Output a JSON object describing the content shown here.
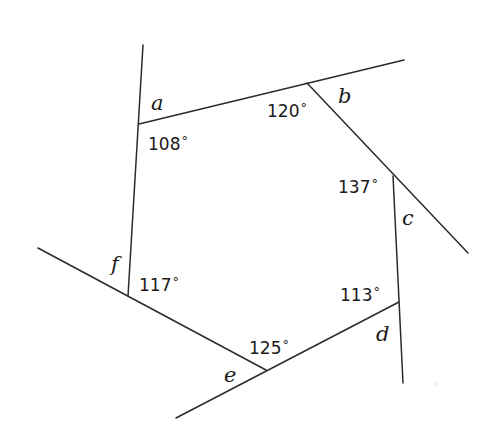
{
  "diagram": {
    "type": "hexagon-exterior-angles",
    "stroke_color": "#2b2b2b",
    "vertices": {
      "a": [
        139,
        124
      ],
      "b": [
        307,
        83
      ],
      "c": [
        393,
        176
      ],
      "d": [
        399,
        302
      ],
      "e": [
        266,
        370
      ],
      "f": [
        128,
        296
      ]
    },
    "lines": [
      {
        "id": "line-fa",
        "x1": 143,
        "y1": 45,
        "x2": 128,
        "y2": 296
      },
      {
        "id": "line-ab",
        "x1": 139,
        "y1": 124,
        "x2": 404,
        "y2": 60
      },
      {
        "id": "line-bc",
        "x1": 307,
        "y1": 83,
        "x2": 468,
        "y2": 253
      },
      {
        "id": "line-cd",
        "x1": 393,
        "y1": 176,
        "x2": 403,
        "y2": 383
      },
      {
        "id": "line-de",
        "x1": 399,
        "y1": 302,
        "x2": 176,
        "y2": 418
      },
      {
        "id": "line-ef",
        "x1": 38,
        "y1": 248,
        "x2": 266,
        "y2": 370
      }
    ],
    "interior_angles": [
      {
        "vertex": "a",
        "value": "108",
        "unit": "°",
        "x": 148,
        "y": 150
      },
      {
        "vertex": "b",
        "value": "120",
        "unit": "°",
        "x": 267,
        "y": 117
      },
      {
        "vertex": "c",
        "value": "137",
        "unit": "°",
        "x": 338,
        "y": 193
      },
      {
        "vertex": "d",
        "value": "113",
        "unit": "°",
        "x": 340,
        "y": 301
      },
      {
        "vertex": "e",
        "value": "125",
        "unit": "°",
        "x": 249,
        "y": 354
      },
      {
        "vertex": "f",
        "value": "117",
        "unit": "°",
        "x": 139,
        "y": 291
      }
    ],
    "exterior_labels": [
      {
        "vertex": "a",
        "label": "a",
        "x": 151,
        "y": 110
      },
      {
        "vertex": "b",
        "label": "b",
        "x": 338,
        "y": 103
      },
      {
        "vertex": "c",
        "label": "c",
        "x": 402,
        "y": 225
      },
      {
        "vertex": "d",
        "label": "d",
        "x": 376,
        "y": 341
      },
      {
        "vertex": "e",
        "label": "e",
        "x": 224,
        "y": 382
      },
      {
        "vertex": "f",
        "label": "f",
        "x": 111,
        "y": 271
      }
    ]
  }
}
